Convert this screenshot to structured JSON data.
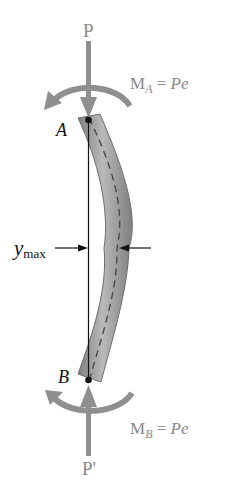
{
  "diagram": {
    "labels": {
      "load_top": "P",
      "load_bottom": "P'",
      "point_top": "A",
      "point_bottom": "B",
      "moment_top_M": "M",
      "moment_top_sub": "A",
      "moment_top_eq": " = ",
      "moment_top_rhs": "Pe",
      "moment_bottom_M": "M",
      "moment_bottom_sub": "B",
      "moment_bottom_eq": " = ",
      "moment_bottom_rhs": "Pe",
      "deflection_y": "y",
      "deflection_sub": "max"
    },
    "colors": {
      "force_arrow": "#8f8f8f",
      "beam_fill": "#9c9c9c",
      "beam_edge": "#7a7a7a",
      "beam_highlight": "#bdbdbd",
      "label_grey": "#8a8a8a",
      "label_black": "#111111"
    }
  }
}
